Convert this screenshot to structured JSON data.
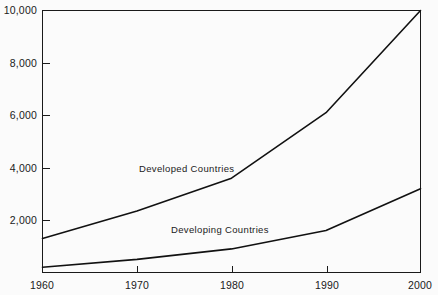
{
  "chart_data": {
    "type": "line",
    "title": "",
    "subtitle": "",
    "xlabel": "",
    "ylabel": "",
    "x": [
      1960,
      1970,
      1980,
      1990,
      2000
    ],
    "xtick_labels": [
      "1960",
      "1970",
      "1980",
      "1990",
      "2000"
    ],
    "ytick_values": [
      2000,
      4000,
      6000,
      8000,
      10000
    ],
    "ytick_labels": [
      "2,000",
      "4,000",
      "6,000",
      "8,000",
      "10,000"
    ],
    "xlim": [
      1960,
      2000
    ],
    "ylim": [
      0,
      10000
    ],
    "grid": false,
    "legend": "inline-labels",
    "series": [
      {
        "name": "Developed Countries",
        "label": "Developed Countries",
        "values": [
          1300,
          2350,
          3600,
          6100,
          10000
        ],
        "color": "#111111"
      },
      {
        "name": "Developing Countries",
        "label": "Developing Countries",
        "values": [
          200,
          500,
          900,
          1600,
          3200
        ],
        "color": "#111111"
      }
    ],
    "annotations": [
      {
        "text": "Developed Countries",
        "x": 1972,
        "y": 4150
      },
      {
        "text": "Developing Countries",
        "x": 1978,
        "y": 1800
      }
    ]
  },
  "axes": {
    "y": {
      "ticks": [
        {
          "label": "2,000",
          "value": 2000
        },
        {
          "label": "4,000",
          "value": 4000
        },
        {
          "label": "6,000",
          "value": 6000
        },
        {
          "label": "8,000",
          "value": 8000
        },
        {
          "label": "10,000",
          "value": 10000
        }
      ]
    },
    "x": {
      "ticks": [
        {
          "label": "1960",
          "value": 1960
        },
        {
          "label": "1970",
          "value": 1970
        },
        {
          "label": "1980",
          "value": 1980
        },
        {
          "label": "1990",
          "value": 1990
        },
        {
          "label": "2000",
          "value": 2000
        }
      ]
    }
  },
  "style": {
    "background": "#fbfbfb",
    "line_color": "#111111",
    "axis_color": "#1a1a1a",
    "text_color": "#1a1a1a"
  }
}
